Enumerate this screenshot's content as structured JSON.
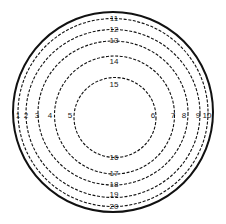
{
  "diagram": {
    "type": "concentric-rings",
    "colors": {
      "stroke": "#111111",
      "background": "#ffffff",
      "text": "#1a1a1a"
    },
    "outer_boundary": {
      "style": "solid",
      "cx": 113,
      "cy": 112,
      "rx": 100,
      "ry": 100
    },
    "rings": [
      {
        "style": "dashed",
        "cx": 113,
        "cy": 112.5,
        "rx": 95,
        "ry": 94
      },
      {
        "style": "dashed",
        "cx": 113,
        "cy": 113.5,
        "rx": 87,
        "ry": 84
      },
      {
        "style": "dashed",
        "cx": 113,
        "cy": 113,
        "rx": 75,
        "ry": 72
      },
      {
        "style": "dashed",
        "cx": 114.5,
        "cy": 115,
        "rx": 60,
        "ry": 59
      },
      {
        "style": "dashed",
        "cx": 115,
        "cy": 117.5,
        "rx": 41,
        "ry": 40
      }
    ],
    "labels": {
      "left": [
        {
          "text": "1",
          "x": 18,
          "y": 118
        },
        {
          "text": "2",
          "x": 26,
          "y": 118
        },
        {
          "text": "3",
          "x": 37,
          "y": 118
        },
        {
          "text": "4",
          "x": 50,
          "y": 118
        },
        {
          "text": "5",
          "x": 70,
          "y": 118
        }
      ],
      "right": [
        {
          "text": "6",
          "x": 153,
          "y": 118
        },
        {
          "text": "7",
          "x": 173,
          "y": 118
        },
        {
          "text": "8",
          "x": 184,
          "y": 118
        },
        {
          "text": "9",
          "x": 198,
          "y": 118
        },
        {
          "text": "10",
          "x": 207,
          "y": 118
        }
      ],
      "top": [
        {
          "text": "11",
          "x": 114,
          "y": 21
        },
        {
          "text": "12",
          "x": 114,
          "y": 32
        },
        {
          "text": "13",
          "x": 114,
          "y": 43
        },
        {
          "text": "14",
          "x": 114,
          "y": 64
        },
        {
          "text": "15",
          "x": 114,
          "y": 87
        }
      ],
      "bottom": [
        {
          "text": "16",
          "x": 114,
          "y": 160
        },
        {
          "text": "17",
          "x": 114,
          "y": 176
        },
        {
          "text": "18",
          "x": 114,
          "y": 187
        },
        {
          "text": "19",
          "x": 114,
          "y": 197
        },
        {
          "text": "20",
          "x": 114,
          "y": 209
        }
      ]
    }
  }
}
